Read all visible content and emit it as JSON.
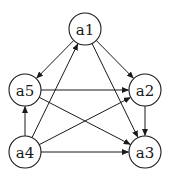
{
  "diagram": {
    "type": "directed-graph",
    "colors": {
      "stroke": "#1a1a1a",
      "node_fill": "#ffffff",
      "background": "#ffffff"
    },
    "node_radius": 16,
    "nodes": [
      {
        "id": "a1",
        "label": "a1",
        "x": 85,
        "y": 29
      },
      {
        "id": "a2",
        "label": "a2",
        "x": 145,
        "y": 90
      },
      {
        "id": "a3",
        "label": "a3",
        "x": 145,
        "y": 152
      },
      {
        "id": "a4",
        "label": "a4",
        "x": 25,
        "y": 152
      },
      {
        "id": "a5",
        "label": "a5",
        "x": 25,
        "y": 90
      }
    ],
    "edges": [
      {
        "from": "a1",
        "to": "a5"
      },
      {
        "from": "a1",
        "to": "a2"
      },
      {
        "from": "a1",
        "to": "a3"
      },
      {
        "from": "a5",
        "to": "a2"
      },
      {
        "from": "a5",
        "to": "a3"
      },
      {
        "from": "a4",
        "to": "a5"
      },
      {
        "from": "a4",
        "to": "a1"
      },
      {
        "from": "a4",
        "to": "a2"
      },
      {
        "from": "a4",
        "to": "a3"
      },
      {
        "from": "a2",
        "to": "a3"
      }
    ]
  }
}
